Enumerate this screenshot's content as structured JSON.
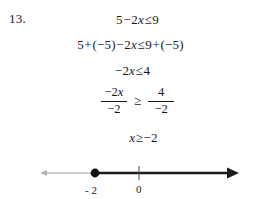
{
  "problem": {
    "number": "13.",
    "steps": [
      {
        "id": "step-1",
        "text": "5 − 2x ≤ 9",
        "parts": {
          "lhs": "5 − 2x",
          "relation": "≤",
          "rhs": "9"
        }
      },
      {
        "id": "step-2",
        "text": "5 + (−5) − 2x ≤ 9 + (−5)",
        "parts": {
          "lhs": "5 + (−5) − 2x",
          "relation": "≤",
          "rhs": "9 + (−5)"
        }
      },
      {
        "id": "step-3",
        "text": "−2x ≤ 4",
        "parts": {
          "lhs": "−2x",
          "relation": "≤",
          "rhs": "4"
        }
      },
      {
        "id": "step-4",
        "text": "−2x / −2 ≥ 4 / −2",
        "parts": {
          "lhs_numerator": "−2x",
          "lhs_denominator": "−2",
          "relation": "≥",
          "rhs_numerator": "4",
          "rhs_denominator": "−2"
        }
      },
      {
        "id": "step-5",
        "text": "x ≥ −2",
        "parts": {
          "lhs": "x",
          "relation": "≥",
          "rhs": "−2"
        }
      }
    ],
    "solution": "x ≥ −2"
  },
  "equations": {
    "line1": {
      "a": "5",
      "op1": "−",
      "b": "2",
      "var": "x",
      "rel": "≤",
      "c": "9"
    },
    "line2": {
      "a": "5",
      "op1": "+",
      "b": "(−5)",
      "op2": "−",
      "c": "2",
      "var": "x",
      "rel": "≤",
      "d": "9",
      "op3": "+",
      "e": "(−5)"
    },
    "line3": {
      "a": "−2",
      "var": "x",
      "rel": "≤",
      "b": "4"
    },
    "line4": {
      "lnum_coef": "−2",
      "lnum_var": "x",
      "lden": "−2",
      "rel": "≥",
      "rnum": "4",
      "rden": "−2"
    },
    "line5": {
      "var": "x",
      "rel": "≥",
      "val": "−2"
    }
  },
  "numberline": {
    "labels": {
      "point": "- 2",
      "origin": "0"
    },
    "point_value": -2,
    "point_type": "closed-circle",
    "ray_direction": "right",
    "left_arrow_style": "thin-light",
    "right_arrow_style": "bold-solid",
    "ticks": [
      {
        "label": "- 2",
        "x": 95,
        "kind": "solution-point"
      },
      {
        "label": "0",
        "x": 139,
        "kind": "origin-tick"
      }
    ],
    "colors": {
      "bold_line": "#1a1a1a",
      "thin_line": "#8c8c8c",
      "point_fill": "#111111"
    }
  },
  "page": {
    "background": "#ffffff",
    "text_color": "#1a1a1a"
  }
}
